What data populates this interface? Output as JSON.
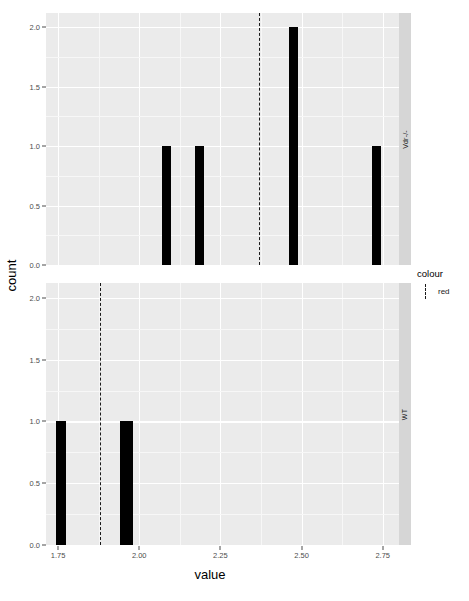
{
  "chart_data": {
    "type": "bar",
    "title": "",
    "xlabel": "value",
    "ylabel": "count",
    "xlim": [
      1.713,
      2.8
    ],
    "ylim": [
      0,
      2.12
    ],
    "xticks": [
      "1.75",
      "2.00",
      "2.25",
      "2.50",
      "2.75"
    ],
    "xtick_values": [
      1.75,
      2.0,
      2.25,
      2.5,
      2.75
    ],
    "yticks": [
      "0.0",
      "0.5",
      "1.0",
      "1.5",
      "2.0"
    ],
    "ytick_values": [
      0.0,
      0.5,
      1.0,
      1.5,
      2.0
    ],
    "grid": true,
    "legend": {
      "title": "colour",
      "position": "right",
      "entries": [
        {
          "label": "red",
          "style": "dashed-vline",
          "color": "#1a1a1a"
        }
      ]
    },
    "facets": [
      {
        "strip_label": "Vdr-/-",
        "bars": [
          {
            "x": 2.085,
            "width": 0.028,
            "count": 1
          },
          {
            "x": 2.185,
            "width": 0.028,
            "count": 1
          },
          {
            "x": 2.475,
            "width": 0.03,
            "count": 2
          },
          {
            "x": 2.73,
            "width": 0.028,
            "count": 1
          }
        ],
        "vline": {
          "x": 2.368,
          "style": "dashed",
          "color": "#1a1a1a"
        }
      },
      {
        "strip_label": "WT",
        "bars": [
          {
            "x": 1.76,
            "width": 0.03,
            "count": 1
          },
          {
            "x": 1.96,
            "width": 0.04,
            "count": 1
          }
        ],
        "vline": {
          "x": 1.88,
          "style": "dashed",
          "color": "#1a1a1a"
        }
      }
    ],
    "colors": {
      "panel_background": "#ebebeb",
      "grid_major": "#ffffff",
      "grid_minor": "#f7f7f7",
      "bar_fill": "#000000",
      "strip_background": "#d6d6d6",
      "axis_text": "#4d4d4d",
      "plot_background": "#ffffff"
    }
  },
  "caption": {
    "text": ""
  }
}
